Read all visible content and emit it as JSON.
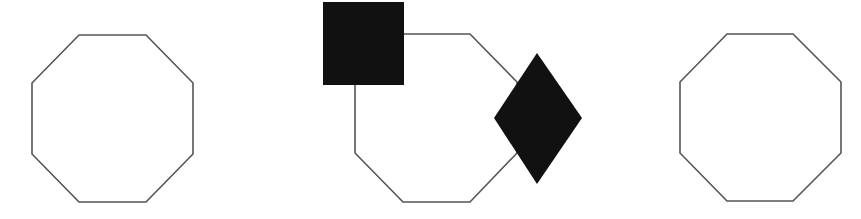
{
  "diagram": {
    "background": "#ffffff",
    "stroke_color": "#555555",
    "fill_color": "#111111",
    "panels": [
      {
        "name": "octagon-left",
        "shape": "octagon",
        "points": "79,35 146,35 193,83 193,154 146,202 79,202 32,154 32,83"
      },
      {
        "name": "octagon-middle",
        "shape": "octagon",
        "points": "403,34 470,34 517,82 517,153 470,202 403,202 355,153 355,82",
        "overlays": [
          {
            "name": "filled-square",
            "shape": "square",
            "x": 323,
            "y": 2,
            "width": 81,
            "height": 83
          },
          {
            "name": "filled-diamond",
            "shape": "diamond",
            "points": "537,53 582,118 537,184 494,118"
          }
        ]
      },
      {
        "name": "octagon-right",
        "shape": "octagon",
        "points": "727,34 793,34 841,82 841,153 793,201 727,201 680,153 680,82"
      }
    ]
  }
}
